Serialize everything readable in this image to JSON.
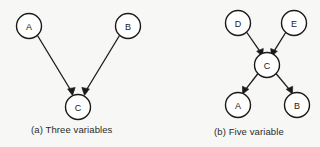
{
  "figure": {
    "background_color": "#f7f7f5",
    "stroke_color": "#1a1a1a",
    "node_fill_color": "#ffffff"
  },
  "panels": [
    {
      "id": "panel-a",
      "caption": "(a) Three variables",
      "nodes": [
        {
          "id": "a",
          "label": "A",
          "cx": 29,
          "cy": 26,
          "r": 12.5
        },
        {
          "id": "b",
          "label": "B",
          "cx": 128,
          "cy": 26,
          "r": 12.5
        },
        {
          "id": "c",
          "label": "C",
          "cx": 78,
          "cy": 107,
          "r": 12.5
        }
      ],
      "edges": [
        {
          "id": "a-to-c",
          "from": "A",
          "to": "C",
          "directed": true
        },
        {
          "id": "b-to-c",
          "from": "B",
          "to": "C",
          "directed": true
        }
      ]
    },
    {
      "id": "panel-b",
      "caption": "(b) Five variable",
      "nodes": [
        {
          "id": "d",
          "label": "D",
          "cx": 238,
          "cy": 23,
          "r": 12.5
        },
        {
          "id": "e",
          "label": "E",
          "cx": 294,
          "cy": 23,
          "r": 12.5
        },
        {
          "id": "c",
          "label": "C",
          "cx": 267,
          "cy": 65,
          "r": 12.5
        },
        {
          "id": "a",
          "label": "A",
          "cx": 238,
          "cy": 105,
          "r": 12.5
        },
        {
          "id": "b",
          "label": "B",
          "cx": 297,
          "cy": 105,
          "r": 12.5
        }
      ],
      "edges": [
        {
          "id": "d-to-c",
          "from": "D",
          "to": "C",
          "directed": true
        },
        {
          "id": "e-to-c",
          "from": "E",
          "to": "C",
          "directed": true
        },
        {
          "id": "c-to-a",
          "from": "C",
          "to": "A",
          "directed": true
        },
        {
          "id": "c-to-b",
          "from": "C",
          "to": "B",
          "directed": true
        }
      ]
    }
  ]
}
